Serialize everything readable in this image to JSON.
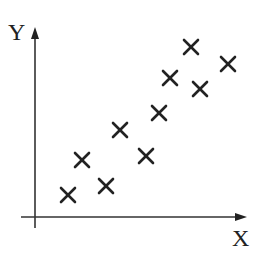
{
  "chart_data": {
    "type": "scatter",
    "title": "",
    "xlabel": "X",
    "ylabel": "Y",
    "grid": false,
    "legend": null,
    "marker": "x",
    "color": "#222222",
    "points": [
      {
        "x": 1.0,
        "y": 0.9
      },
      {
        "x": 1.4,
        "y": 2.2
      },
      {
        "x": 2.2,
        "y": 1.2
      },
      {
        "x": 2.6,
        "y": 3.3
      },
      {
        "x": 3.5,
        "y": 2.3
      },
      {
        "x": 3.9,
        "y": 3.9
      },
      {
        "x": 4.3,
        "y": 5.2
      },
      {
        "x": 5.0,
        "y": 6.4
      },
      {
        "x": 5.3,
        "y": 4.8
      },
      {
        "x": 6.2,
        "y": 5.7
      }
    ],
    "xlim": [
      0,
      7.2
    ],
    "ylim": [
      0,
      7.2
    ],
    "pixel_points": [
      [
        68,
        195
      ],
      [
        82,
        160
      ],
      [
        106,
        186
      ],
      [
        120,
        130
      ],
      [
        146,
        156
      ],
      [
        159,
        113
      ],
      [
        170,
        78
      ],
      [
        191,
        47
      ],
      [
        200,
        89
      ],
      [
        228,
        64
      ]
    ]
  },
  "axes": {
    "x_label": "X",
    "y_label": "Y"
  }
}
